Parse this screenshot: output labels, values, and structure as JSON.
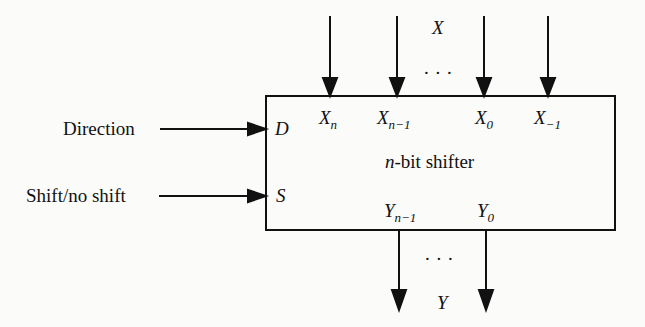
{
  "diagram": {
    "title": "n-bit shifter",
    "title_italic_part": "n",
    "title_rest": "-bit shifter",
    "input_bus_label": "X",
    "output_bus_label": "Y",
    "ellipsis": ". . .",
    "control_inputs": [
      {
        "label": "Direction",
        "port": "D"
      },
      {
        "label": "Shift/no shift",
        "port": "S"
      }
    ],
    "inputs": [
      {
        "base": "X",
        "sub": "n"
      },
      {
        "base": "X",
        "sub": "n−1"
      },
      {
        "base": "X",
        "sub": "0"
      },
      {
        "base": "X",
        "sub": "−1"
      }
    ],
    "outputs": [
      {
        "base": "Y",
        "sub": "n−1"
      },
      {
        "base": "Y",
        "sub": "0"
      }
    ]
  }
}
